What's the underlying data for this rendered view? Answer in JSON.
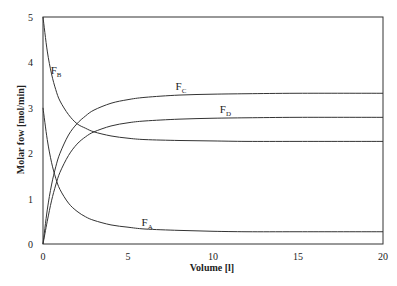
{
  "chart_data": {
    "type": "line",
    "title": "",
    "xlabel": "Volume [l]",
    "ylabel": "Molar fow [mol/min]",
    "xlim": [
      0,
      20
    ],
    "ylim": [
      0,
      5
    ],
    "xticks": [
      "0",
      "5",
      "10",
      "15",
      "20"
    ],
    "yticks": [
      "0",
      "1",
      "2",
      "3",
      "4",
      "5"
    ],
    "grid": false,
    "legend": "inline curve labels",
    "x": [
      0,
      0.25,
      0.5,
      0.75,
      1,
      1.5,
      2,
      2.5,
      3,
      4,
      5,
      6,
      8,
      10,
      12,
      15,
      20
    ],
    "series": [
      {
        "name": "FA",
        "label_main": "F",
        "label_sub": "A",
        "label_at": [
          5.8,
          0.4
        ],
        "values": [
          3.0,
          2.3,
          1.8,
          1.45,
          1.2,
          0.9,
          0.72,
          0.6,
          0.52,
          0.42,
          0.37,
          0.33,
          0.3,
          0.28,
          0.27,
          0.27,
          0.27
        ]
      },
      {
        "name": "FB",
        "label_main": "F",
        "label_sub": "B",
        "label_at": [
          0.45,
          3.75
        ],
        "values": [
          5.0,
          4.25,
          3.75,
          3.4,
          3.15,
          2.85,
          2.65,
          2.55,
          2.47,
          2.38,
          2.33,
          2.3,
          2.28,
          2.27,
          2.26,
          2.26,
          2.26
        ]
      },
      {
        "name": "FC",
        "label_main": "F",
        "label_sub": "C",
        "label_at": [
          7.8,
          3.4
        ],
        "values": [
          0.0,
          0.75,
          1.3,
          1.7,
          2.0,
          2.4,
          2.65,
          2.82,
          2.95,
          3.1,
          3.18,
          3.23,
          3.28,
          3.3,
          3.31,
          3.32,
          3.32
        ]
      },
      {
        "name": "FD",
        "label_main": "F",
        "label_sub": "D",
        "label_at": [
          10.4,
          2.88
        ],
        "values": [
          0.0,
          0.5,
          0.95,
          1.3,
          1.58,
          1.95,
          2.2,
          2.36,
          2.47,
          2.6,
          2.67,
          2.71,
          2.75,
          2.77,
          2.78,
          2.79,
          2.79
        ]
      }
    ]
  }
}
